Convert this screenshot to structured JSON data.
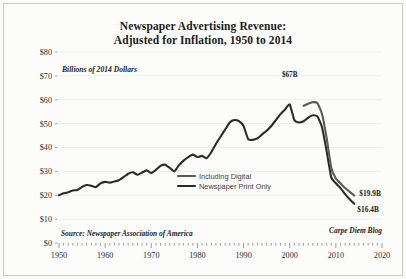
{
  "title": {
    "line1": "Newspaper Advertising Revenue:",
    "line2": "Adjusted for Inflation, 1950 to 2014"
  },
  "unit_note": "Billions of 2014 Dollars",
  "source_left": "Source: Newspaper Association of America",
  "source_right": "Carpe Diem Blog",
  "annotations": {
    "peak": "$67B",
    "end_digital": "$19.9B",
    "end_print": "$16.4B"
  },
  "legend": {
    "items": [
      {
        "label": "Including Digital",
        "color": "#5a5a5a"
      },
      {
        "label": "Newspaper Print Only",
        "color": "#2b2b2b"
      }
    ]
  },
  "colors": {
    "including_digital": "#5a5a5a",
    "print_only": "#2b2b2b",
    "grid": "#e6e6e3",
    "axis": "#5a5a5a",
    "background": "#fcfcfb",
    "border": "#c9c9c6",
    "text": "#1b1b1b"
  },
  "chart_data": {
    "type": "line",
    "title": "Newspaper Advertising Revenue: Adjusted for Inflation, 1950 to 2014",
    "xlabel": "",
    "ylabel": "Billions of 2014 Dollars",
    "xlim": [
      1950,
      2020
    ],
    "ylim": [
      0,
      80
    ],
    "xticks": [
      1950,
      1960,
      1970,
      1980,
      1990,
      2000,
      2010,
      2020
    ],
    "yticks": [
      0,
      10,
      20,
      30,
      40,
      50,
      60,
      70,
      80
    ],
    "ytick_labels": [
      "$0",
      "$10",
      "$20",
      "$30",
      "$40",
      "$50",
      "$60",
      "$70",
      "$80"
    ],
    "xtick_labels": [
      "1950",
      "1960",
      "1970",
      "1980",
      "1990",
      "2000",
      "2010",
      "2020"
    ],
    "minor_tick_interval": 1,
    "grid": "horizontal",
    "legend_position": "inside-center-right",
    "series": [
      {
        "name": "Including Digital",
        "color": "#5a5a5a",
        "x": [
          2003,
          2004,
          2005,
          2006,
          2007,
          2008,
          2009,
          2010,
          2011,
          2012,
          2013,
          2014
        ],
        "values": [
          57.5,
          58.3,
          59.0,
          58.6,
          54.0,
          44.0,
          31.5,
          27.0,
          25.0,
          23.0,
          21.4,
          19.9
        ]
      },
      {
        "name": "Newspaper Print Only",
        "color": "#2b2b2b",
        "x": [
          1950,
          1951,
          1952,
          1953,
          1954,
          1955,
          1956,
          1957,
          1958,
          1959,
          1960,
          1961,
          1962,
          1963,
          1964,
          1965,
          1966,
          1967,
          1968,
          1969,
          1970,
          1971,
          1972,
          1973,
          1974,
          1975,
          1976,
          1977,
          1978,
          1979,
          1980,
          1981,
          1982,
          1983,
          1984,
          1985,
          1986,
          1987,
          1988,
          1989,
          1990,
          1991,
          1992,
          1993,
          1994,
          1995,
          1996,
          1997,
          1998,
          1999,
          2000,
          2001,
          2002,
          2003,
          2004,
          2005,
          2006,
          2007,
          2008,
          2009,
          2010,
          2011,
          2012,
          2013,
          2014
        ],
        "values": [
          20.0,
          20.8,
          21.3,
          22.0,
          22.2,
          23.5,
          24.3,
          24.0,
          23.4,
          25.0,
          25.6,
          25.3,
          25.8,
          26.3,
          27.6,
          29.0,
          29.6,
          28.6,
          29.5,
          30.4,
          29.3,
          30.6,
          32.3,
          32.8,
          31.5,
          30.0,
          32.6,
          34.5,
          36.0,
          37.0,
          36.0,
          36.5,
          35.5,
          38.0,
          41.5,
          44.5,
          47.5,
          50.5,
          51.5,
          51.0,
          49.0,
          43.5,
          43.2,
          43.8,
          45.5,
          47.0,
          49.0,
          51.5,
          54.0,
          56.0,
          58.0,
          51.5,
          50.5,
          51.0,
          52.5,
          53.5,
          53.0,
          48.5,
          38.5,
          27.5,
          25.0,
          23.0,
          20.5,
          18.3,
          16.4
        ]
      }
    ],
    "annotations": [
      {
        "text": "$67B",
        "x": 2000,
        "y": 67
      },
      {
        "text": "$19.9B",
        "x": 2014,
        "y": 19.9
      },
      {
        "text": "$16.4B",
        "x": 2014,
        "y": 16.4
      }
    ]
  }
}
